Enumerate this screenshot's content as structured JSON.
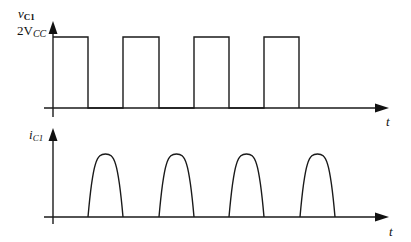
{
  "diagram": {
    "type": "waveform-timing-diagram",
    "panels": [
      {
        "id": "voltage",
        "ylabel_main": "v",
        "ylabel_sub": "C1",
        "level_label_main": "2V",
        "level_label_sub": "CC",
        "xlabel": "t",
        "waveform": "rectangular pulses",
        "pulses": 4
      },
      {
        "id": "current",
        "ylabel_main": "i",
        "ylabel_sub": "C1",
        "xlabel": "t",
        "waveform": "half-sine pulses (in off-intervals of voltage)",
        "pulses": 4
      }
    ]
  },
  "colors": {
    "line": "#1a1a1a",
    "background": "#ffffff"
  }
}
